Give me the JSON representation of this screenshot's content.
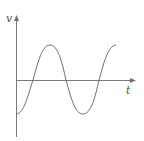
{
  "diagram": {
    "type": "waveform",
    "y_axis_label": "v",
    "x_axis_label": "t",
    "curve_description": "negative cosine wave starting at minimum, about 1.5 periods",
    "colors": {
      "axis": "#7a7a7a",
      "curve": "#6e6e6e",
      "label": "#555555",
      "background": "#ffffff"
    }
  }
}
